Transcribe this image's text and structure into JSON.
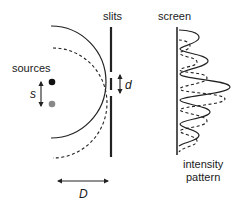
{
  "diagram": {
    "labels": {
      "sources": "sources",
      "slits": "slits",
      "screen": "screen",
      "source_separation": "s",
      "slit_separation": "d",
      "distance": "D",
      "intensity_line1": "intensity",
      "intensity_line2": "pattern"
    },
    "colors": {
      "source_1": "#111111",
      "source_2": "#888888",
      "lines": "#222222"
    },
    "elements": [
      "two point sources separated by s",
      "solid wavefront arc from source 1",
      "dashed wavefront arc from source 2",
      "barrier with two slits separated by d",
      "screen with solid and dashed intensity patterns",
      "distance D between sources and slits"
    ]
  }
}
